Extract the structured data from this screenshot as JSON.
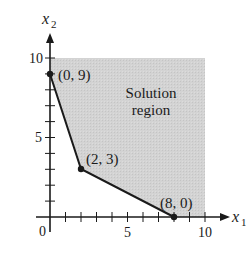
{
  "figure": {
    "type": "linear-inequality-feasible-region",
    "axes": {
      "x_label": "x",
      "x_subscript": "1",
      "y_label": "x",
      "y_subscript": "2",
      "origin_label": "0",
      "x_tick_labels": [
        "5",
        "10"
      ],
      "y_tick_labels": [
        "5",
        "10"
      ],
      "x_range": [
        0,
        10
      ],
      "y_range": [
        0,
        10
      ],
      "tick_step": 1
    },
    "region": {
      "label_line1": "Solution",
      "label_line2": "region",
      "fill_color": "#d0d0d0"
    },
    "boundary_color": "#1a1a1a",
    "vertices": [
      {
        "label": "(0, 9)",
        "x": 0,
        "y": 9
      },
      {
        "label": "(2, 3)",
        "x": 2,
        "y": 3
      },
      {
        "label": "(8, 0)",
        "x": 8,
        "y": 0
      }
    ]
  }
}
